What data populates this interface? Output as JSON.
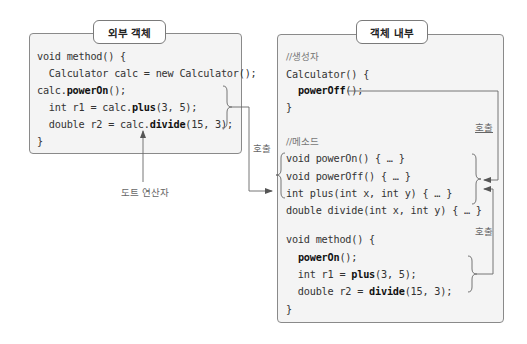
{
  "outer_object": {
    "title": "외부 객체",
    "lines": [
      {
        "pre": "void method() {",
        "bold": "",
        "post": ""
      },
      {
        "pre": "  Calculator calc = new Calculator();",
        "bold": "",
        "post": ""
      },
      {
        "pre": "calc.",
        "bold": "powerOn",
        "post": "();"
      },
      {
        "pre": "  int r1 = calc.",
        "bold": "plus",
        "post": "(3, 5);"
      },
      {
        "pre": "  double r2 = calc.",
        "bold": "divide",
        "post": "(15, 3);"
      },
      {
        "pre": "}",
        "bold": "",
        "post": ""
      }
    ]
  },
  "inner_object": {
    "title": "객체 내부",
    "constructor_comment": "//생성자",
    "constructor_lines": [
      {
        "pre": "Calculator() {",
        "bold": "",
        "post": ""
      },
      {
        "pre": "  ",
        "bold": "powerOff",
        "post": "();"
      },
      {
        "pre": "}",
        "bold": "",
        "post": ""
      }
    ],
    "methods_comment": "//메소드",
    "method_lines": [
      {
        "pre": "void powerOn() { … }",
        "bold": "",
        "post": ""
      },
      {
        "pre": "void powerOff() { … }",
        "bold": "",
        "post": ""
      },
      {
        "pre": "int plus(int x, int y) { … }",
        "bold": "",
        "post": ""
      },
      {
        "pre": "double divide(int x, int y) { … }",
        "bold": "",
        "post": ""
      }
    ],
    "method_body_lines": [
      {
        "pre": "void method() {",
        "bold": "",
        "post": ""
      },
      {
        "pre": "  ",
        "bold": "powerOn",
        "post": "();"
      },
      {
        "pre": "  int r1 = ",
        "bold": "plus",
        "post": "(3, 5);"
      },
      {
        "pre": "  double r2 = ",
        "bold": "divide",
        "post": "(15, 3);"
      },
      {
        "pre": "}",
        "bold": "",
        "post": ""
      }
    ]
  },
  "annotations": {
    "call_external": "호출",
    "call_constructor": "호출",
    "call_internal": "호출",
    "dot_operator": "도트 연산자"
  }
}
